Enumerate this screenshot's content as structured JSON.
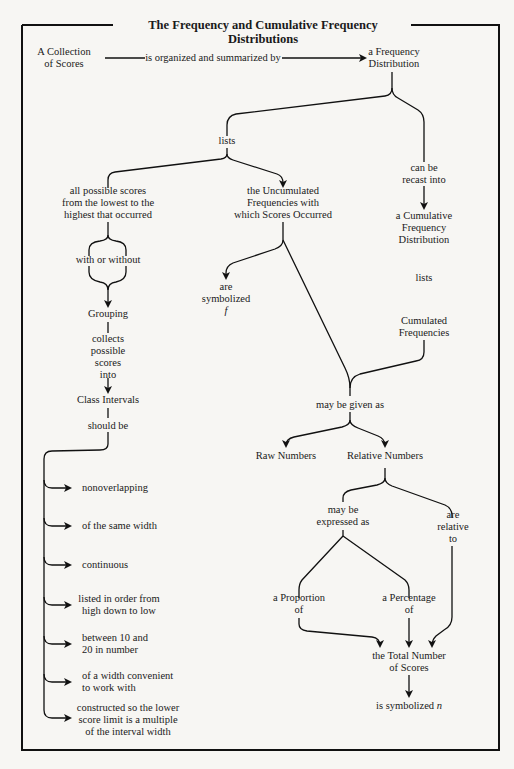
{
  "title": "The Frequency and Cumulative Frequency Distributions",
  "nodes": {
    "collection": "A Collection\nof Scores",
    "organized_by": "is organized and summarized by",
    "freq_dist": "a Frequency\nDistribution",
    "lists": "lists",
    "can_be_recast": "can be\nrecast into",
    "all_possible": "all possible scores\nfrom the lowest to the\nhighest that occurred",
    "uncumulated": "the Uncumulated\nFrequencies with\nwhich Scores Occurred",
    "cum_freq_dist": "a Cumulative\nFrequency\nDistribution",
    "with_or_without": "with or without",
    "are_symbolized": "are\nsymbolized",
    "symbol_f": "f",
    "lists2": "lists",
    "grouping": "Grouping",
    "collects": "collects\npossible\nscores\ninto",
    "cumulated": "Cumulated\nFrequencies",
    "class_intervals": "Class Intervals",
    "should_be": "should be",
    "may_be_given_as": "may be given as",
    "raw_numbers": "Raw Numbers",
    "relative_numbers": "Relative Numbers",
    "may_be_expressed": "may be\nexpressed as",
    "are_relative_to": "are\nrelative\nto",
    "proportion": "a Proportion\nof",
    "percentage": "a Percentage\nof",
    "total_number": "the Total Number\nof Scores",
    "symbolized_n_prefix": "is symbolized ",
    "symbol_n": "n"
  },
  "class_interval_rules": [
    "nonoverlapping",
    "of the same width",
    "continuous",
    "listed in order from\nhigh down to low",
    "between 10 and\n20 in number",
    "of a width convenient\nto work with",
    "constructed so the lower\nscore limit is a multiple\nof the interval width"
  ]
}
